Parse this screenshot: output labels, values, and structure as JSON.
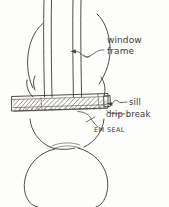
{
  "drawing": {
    "title": "Window sill detail",
    "medium": "hand-drawn pencil sketch",
    "background_color": "#fdfdfc",
    "ink_color": "#3b3834"
  },
  "labels": {
    "window_frame_line1": "window",
    "window_frame_line2": "frame",
    "sill": "sill",
    "drip_break": "drip break",
    "em_seal": "EM SEAL"
  },
  "elements": {
    "window_frame": "window-frame",
    "sill_slab": "sill-slab",
    "drip_break_groove": "drip-break-groove",
    "em_seal_strip": "em-seal-strip",
    "log_upper": "log-upper",
    "log_middle": "log-middle",
    "log_lower": "log-lower"
  }
}
